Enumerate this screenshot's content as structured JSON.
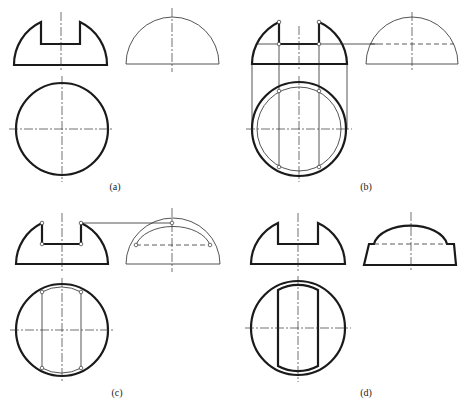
{
  "figure": {
    "panels": [
      {
        "id": "a",
        "label": "(a)"
      },
      {
        "id": "b",
        "label": "(b)"
      },
      {
        "id": "c",
        "label": "(c)"
      },
      {
        "id": "d",
        "label": "(d)"
      }
    ]
  },
  "colors": {
    "line": "#1a1a1a",
    "background": "#ffffff"
  }
}
